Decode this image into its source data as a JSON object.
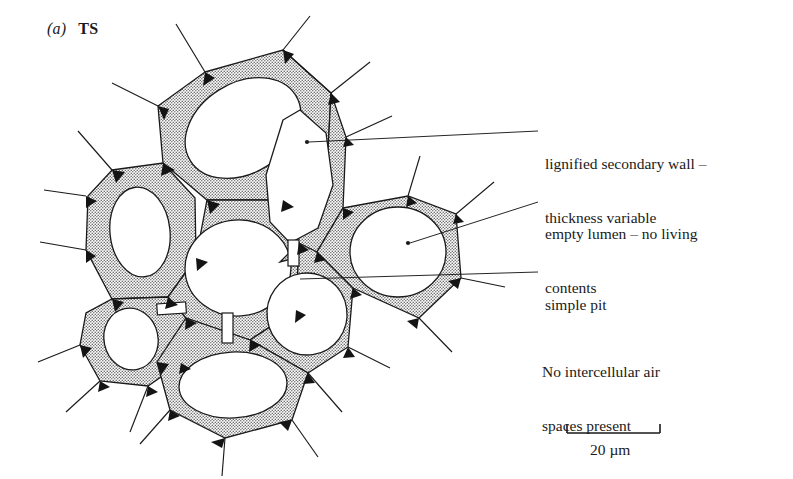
{
  "figure": {
    "panel_id": "(a)",
    "panel_name": "TS"
  },
  "annotations": [
    {
      "key": "lignified_wall",
      "lines": [
        "lignified secondary wall –",
        "thickness variable"
      ],
      "line1": "lignified secondary wall –",
      "line2": "thickness variable"
    },
    {
      "key": "empty_lumen",
      "lines": [
        "empty lumen – no living",
        "contents"
      ],
      "line1": "empty lumen – no living",
      "line2": "contents"
    },
    {
      "key": "simple_pit",
      "lines": [
        "simple pit"
      ],
      "line1": "simple pit",
      "line2": ""
    },
    {
      "key": "no_air_spaces",
      "lines": [
        "No intercellular air",
        "spaces present"
      ],
      "line1": "No intercellular air",
      "line2": "spaces present"
    }
  ],
  "scale_bar": {
    "label": "20 µm",
    "value": 20,
    "unit": "µm"
  },
  "colors": {
    "ink": "#1a1a1a",
    "stipple_fill": "#b9b9b9",
    "lumen": "#ffffff",
    "background": "#ffffff",
    "corner_fill": "#111111"
  },
  "diagram": {
    "cell_count": 8,
    "cells": [
      {
        "name": "top-cell",
        "lumen_label": "empty lumen"
      },
      {
        "name": "left-cell",
        "lumen_label": "empty lumen"
      },
      {
        "name": "lower-left-cell",
        "lumen_label": "empty lumen"
      },
      {
        "name": "centre-cell",
        "lumen_label": "empty lumen"
      },
      {
        "name": "upper-right-cell",
        "lumen_label": "empty lumen"
      },
      {
        "name": "middle-right-cell",
        "lumen_label": "empty lumen"
      },
      {
        "name": "bottom-cell",
        "lumen_label": "empty lumen"
      },
      {
        "name": "right-cell",
        "lumen_label": "empty lumen"
      }
    ],
    "pit_count": 3
  }
}
